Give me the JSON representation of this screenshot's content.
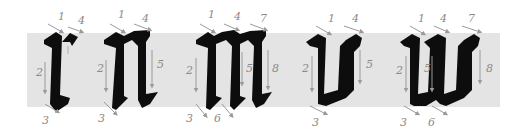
{
  "colors": {
    "band": "#e4e4e4",
    "ink": "#0d0d0d",
    "guide": "#9a9a9a",
    "background": "#ffffff"
  },
  "letters": [
    {
      "char": "r",
      "strokes": [
        "1",
        "2",
        "3",
        "4"
      ]
    },
    {
      "char": "n",
      "strokes": [
        "1",
        "2",
        "3",
        "4",
        "5"
      ]
    },
    {
      "char": "m",
      "strokes": [
        "1",
        "2",
        "3",
        "4",
        "5",
        "6",
        "7",
        "8"
      ]
    },
    {
      "char": "v",
      "strokes": [
        "1",
        "2",
        "3",
        "4",
        "5"
      ]
    },
    {
      "char": "w",
      "strokes": [
        "1",
        "2",
        "3",
        "4",
        "5",
        "6",
        "7",
        "8"
      ]
    }
  ],
  "labels": {
    "r": {
      "s1": "1",
      "s2": "2",
      "s3": "3",
      "s4": "4"
    },
    "n": {
      "s1": "1",
      "s2": "2",
      "s3": "3",
      "s4": "4",
      "s5": "5"
    },
    "m": {
      "s1": "1",
      "s2": "2",
      "s3": "3",
      "s4": "4",
      "s5": "5",
      "s6": "6",
      "s7": "7",
      "s8": "8"
    },
    "v": {
      "s1": "1",
      "s2": "2",
      "s3": "3",
      "s4": "4",
      "s5": "5"
    },
    "w": {
      "s1": "1",
      "s2": "2",
      "s3": "3",
      "s4": "4",
      "s5": "5",
      "s6": "6",
      "s7": "7",
      "s8": "8"
    }
  }
}
